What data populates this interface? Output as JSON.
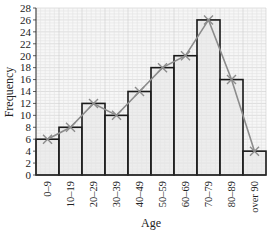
{
  "chart_data": {
    "type": "bar",
    "title": "",
    "xlabel": "Age",
    "ylabel": "Frequency",
    "categories": [
      "0–9",
      "10–19",
      "20–29",
      "30–39",
      "40–49",
      "50–59",
      "60–69",
      "70–79",
      "80–89",
      "over 90"
    ],
    "series": [
      {
        "name": "Frequency (histogram)",
        "kind": "bar",
        "values": [
          6,
          8,
          12,
          10,
          14,
          18,
          20,
          26,
          16,
          4
        ]
      },
      {
        "name": "Frequency polygon",
        "kind": "line",
        "marker": "x",
        "values": [
          6,
          8,
          12,
          10,
          14,
          18,
          20,
          26,
          16,
          4
        ]
      }
    ],
    "ylim": [
      0,
      28
    ],
    "yticks": [
      0,
      2,
      4,
      6,
      8,
      10,
      12,
      14,
      16,
      18,
      20,
      22,
      24,
      26,
      28
    ],
    "grid": true,
    "legend": null
  },
  "colors": {
    "bar_fill": "#e6e6e6",
    "bar_stroke": "#1a1a1a",
    "grid_minor": "#e2e2e2",
    "grid_major": "#cfcfcf",
    "polygon": "#8c8c8c"
  }
}
